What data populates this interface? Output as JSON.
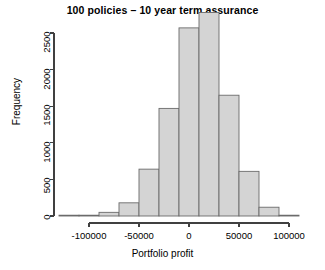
{
  "chart_data": {
    "type": "bar",
    "title": "100 policies – 10 year term assurance",
    "xlabel": "Portfolio profit",
    "ylabel": "Frequency",
    "xlim": [
      -130000,
      110000
    ],
    "ylim": [
      0,
      2900
    ],
    "grid": false,
    "legend": null,
    "bin_width": 20000,
    "bin_edges": [
      -130000,
      -110000,
      -90000,
      -70000,
      -50000,
      -30000,
      -10000,
      10000,
      30000,
      50000,
      70000,
      90000,
      110000
    ],
    "categories": [
      "-130000 to -110000",
      "-110000 to -90000",
      "-90000 to -70000",
      "-70000 to -50000",
      "-50000 to -30000",
      "-30000 to -10000",
      "-10000 to 10000",
      "10000 to 30000",
      "30000 to 50000",
      "50000 to 70000",
      "70000 to 90000",
      "90000 to 110000"
    ],
    "values": [
      5,
      10,
      50,
      180,
      640,
      1470,
      2570,
      2780,
      1650,
      610,
      120,
      10
    ],
    "bar_fill_color": "#d4d4d4",
    "bar_border_color": "#6b6b6b",
    "xticks": [
      -100000,
      -50000,
      0,
      50000,
      100000
    ],
    "xtick_labels": [
      "-100000",
      "-50000",
      "0",
      "50000",
      "100000"
    ],
    "yticks": [
      0,
      500,
      1000,
      1500,
      2000,
      2500
    ],
    "ytick_labels": [
      "0",
      "500",
      "1000",
      "1500",
      "2000",
      "2500"
    ]
  }
}
